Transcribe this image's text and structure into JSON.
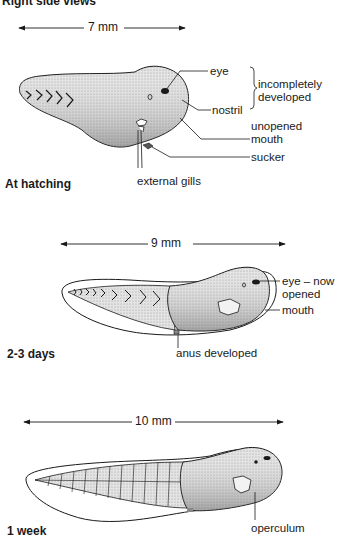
{
  "title": "Right side views",
  "stages": [
    {
      "name": "At hatching",
      "length": "7 mm",
      "labels": {
        "eye": "eye",
        "nostril": "nostril",
        "bracket_note_line1": "incompletely",
        "bracket_note_line2": "developed",
        "mouth_line1": "unopened",
        "mouth_line2": "mouth",
        "sucker": "sucker",
        "gills": "external gills"
      }
    },
    {
      "name": "2-3 days",
      "length": "9 mm",
      "labels": {
        "eye_line1": "eye – now",
        "eye_line2": "opened",
        "mouth": "mouth",
        "anus": "anus developed"
      }
    },
    {
      "name": "1 week",
      "length": "10 mm",
      "labels": {
        "operculum": "operculum"
      }
    }
  ],
  "colors": {
    "ink": "#1a1a1a",
    "body_fill": "#d9d9d9",
    "background": "#ffffff"
  }
}
